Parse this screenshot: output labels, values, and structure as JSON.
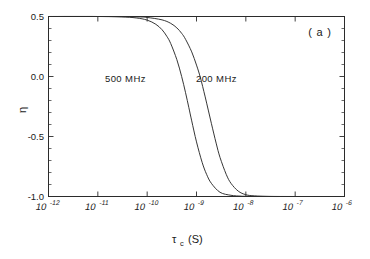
{
  "figure": {
    "panel_label": "( a )",
    "background_color": "#ffffff",
    "line_color": "#2b2b2b"
  },
  "chart_data": {
    "type": "line",
    "title": "",
    "subtitle": "",
    "xlabel": "τ",
    "xlabel_sub": "c",
    "xlabel_unit": "(S)",
    "ylabel": "η",
    "xscale": "log",
    "xlim": [
      1e-12,
      1e-06
    ],
    "ylim": [
      -1.0,
      0.5
    ],
    "grid": false,
    "legend_position": "inline-annotations",
    "x_tick_labels": [
      {
        "mantissa": "10",
        "exponent": "-12",
        "value": 1e-12
      },
      {
        "mantissa": "10",
        "exponent": "-11",
        "value": 1e-11
      },
      {
        "mantissa": "10",
        "exponent": "-10",
        "value": 1e-10
      },
      {
        "mantissa": "10",
        "exponent": "-9",
        "value": 1e-09
      },
      {
        "mantissa": "10",
        "exponent": "-8",
        "value": 1e-08
      },
      {
        "mantissa": "10",
        "exponent": "-7",
        "value": 1e-07
      },
      {
        "mantissa": "10",
        "exponent": "-6",
        "value": 1e-06
      }
    ],
    "y_tick_labels": [
      {
        "label": "0.5",
        "value": 0.5
      },
      {
        "label": "0.0",
        "value": 0.0
      },
      {
        "label": "-0.5",
        "value": -0.5
      },
      {
        "label": "-1.0",
        "value": -1.0
      }
    ],
    "y_minor_count_per_interval": 4,
    "x_minor_ticks": false,
    "annotations": [
      {
        "text": "500 MHz",
        "x": 1.1e-10,
        "y": 0.02
      },
      {
        "text": "200 MHz",
        "x": 3.3e-09,
        "y": 0.02
      },
      {
        "text": "( a )",
        "x": 3e-07,
        "y": 0.42
      }
    ],
    "series": [
      {
        "name": "500 MHz",
        "frequency_mhz": 500,
        "x": [
          1e-12,
          1e-11,
          3e-11,
          6e-11,
          1e-10,
          1.5e-10,
          2e-10,
          2.5e-10,
          3e-10,
          4e-10,
          5e-10,
          6e-10,
          7e-10,
          8e-10,
          1e-09,
          1.3e-09,
          1.6e-09,
          2e-09,
          3e-09,
          5e-09,
          8e-09,
          1e-08,
          3e-08,
          1e-07,
          1e-06
        ],
        "y": [
          0.5,
          0.5,
          0.497,
          0.488,
          0.47,
          0.435,
          0.39,
          0.335,
          0.275,
          0.14,
          0.0,
          -0.135,
          -0.26,
          -0.37,
          -0.545,
          -0.715,
          -0.815,
          -0.89,
          -0.965,
          -0.99,
          -0.997,
          -0.998,
          -1.0,
          -1.0,
          -1.0
        ]
      },
      {
        "name": "200 MHz",
        "frequency_mhz": 200,
        "x": [
          1e-12,
          1e-11,
          6e-11,
          1e-10,
          2e-10,
          3e-10,
          4e-10,
          5e-10,
          6e-10,
          8e-10,
          1e-09,
          1.2e-09,
          1.5e-09,
          2e-09,
          2.5e-09,
          3e-09,
          4e-09,
          5e-09,
          7e-09,
          1e-08,
          1.5e-08,
          3e-08,
          1e-07,
          1e-06
        ],
        "y": [
          0.5,
          0.5,
          0.497,
          0.492,
          0.472,
          0.443,
          0.405,
          0.36,
          0.31,
          0.205,
          0.095,
          -0.01,
          -0.17,
          -0.39,
          -0.555,
          -0.675,
          -0.815,
          -0.89,
          -0.955,
          -0.985,
          -0.995,
          -0.999,
          -1.0,
          -1.0
        ]
      }
    ]
  }
}
